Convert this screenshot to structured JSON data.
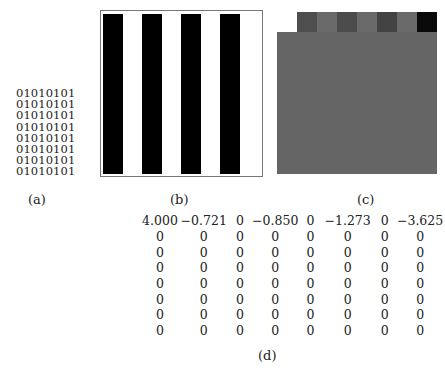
{
  "panel_a": {
    "rows": [
      "01010101",
      "01010101",
      "01010101",
      "01010101",
      "01010101",
      "01010101",
      "01010101",
      "01010101"
    ],
    "caption": "(a)"
  },
  "panel_b": {
    "caption": "(b)",
    "stripe_color": "#000000",
    "background": "#ffffff"
  },
  "panel_c": {
    "caption": "(c)",
    "base_color": "#656565",
    "top_row_colors": [
      "#ffffff",
      "#4e4e4e",
      "#6a6a6a",
      "#4c4c4c",
      "#6a6a6a",
      "#434343",
      "#6a6a6a",
      "#0a0a0a"
    ]
  },
  "panel_d": {
    "caption": "(d)",
    "matrix": [
      [
        "4.000",
        "−0.721",
        "0",
        "−0.850",
        "0",
        "−1.273",
        "0",
        "−3.625"
      ],
      [
        "0",
        "0",
        "0",
        "0",
        "0",
        "0",
        "0",
        "0"
      ],
      [
        "0",
        "0",
        "0",
        "0",
        "0",
        "0",
        "0",
        "0"
      ],
      [
        "0",
        "0",
        "0",
        "0",
        "0",
        "0",
        "0",
        "0"
      ],
      [
        "0",
        "0",
        "0",
        "0",
        "0",
        "0",
        "0",
        "0"
      ],
      [
        "0",
        "0",
        "0",
        "0",
        "0",
        "0",
        "0",
        "0"
      ],
      [
        "0",
        "0",
        "0",
        "0",
        "0",
        "0",
        "0",
        "0"
      ],
      [
        "0",
        "0",
        "0",
        "0",
        "0",
        "0",
        "0",
        "0"
      ]
    ]
  }
}
